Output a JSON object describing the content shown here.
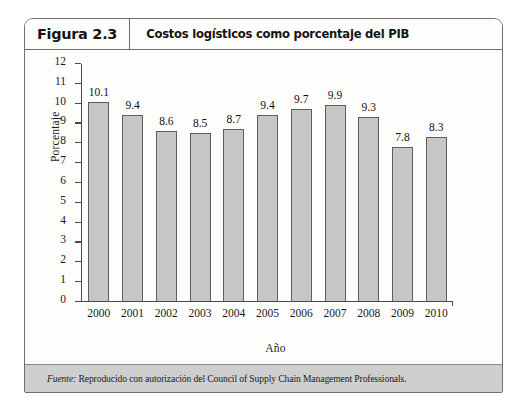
{
  "figure": {
    "number": "Figura 2.3",
    "title": "Costos logísticos como porcentaje del PIB",
    "source_label": "Fuente:",
    "source_text": " Reproducido con autorización del Council of Supply Chain Management Professionals."
  },
  "chart_data": {
    "type": "bar",
    "title": "Costos logísticos como porcentaje del PIB",
    "xlabel": "Año",
    "ylabel": "Porcentaje",
    "categories": [
      "2000",
      "2001",
      "2002",
      "2003",
      "2004",
      "2005",
      "2006",
      "2007",
      "2008",
      "2009",
      "2010"
    ],
    "values": [
      10.1,
      9.4,
      8.6,
      8.5,
      8.7,
      9.4,
      9.7,
      9.9,
      9.3,
      7.8,
      8.3
    ],
    "data_labels": [
      "10.1",
      "9.4",
      "8.6",
      "8.5",
      "8.7",
      "9.4",
      "9.7",
      "9.9",
      "9.3",
      "7.8",
      "8.3"
    ],
    "ylim": [
      0,
      12
    ],
    "yticks": [
      0,
      1,
      2,
      3,
      4,
      5,
      6,
      7,
      8,
      9,
      10,
      11,
      12
    ],
    "ytick_labels": [
      "0",
      "1",
      "2",
      "3",
      "4",
      "5",
      "6",
      "7",
      "8",
      "9",
      "10",
      "11",
      "12"
    ],
    "grid": false,
    "legend": false,
    "bar_color": "#c6c6c6",
    "bar_edge_color": "#5d5d5d",
    "axis_color": "#4a4a4a"
  }
}
